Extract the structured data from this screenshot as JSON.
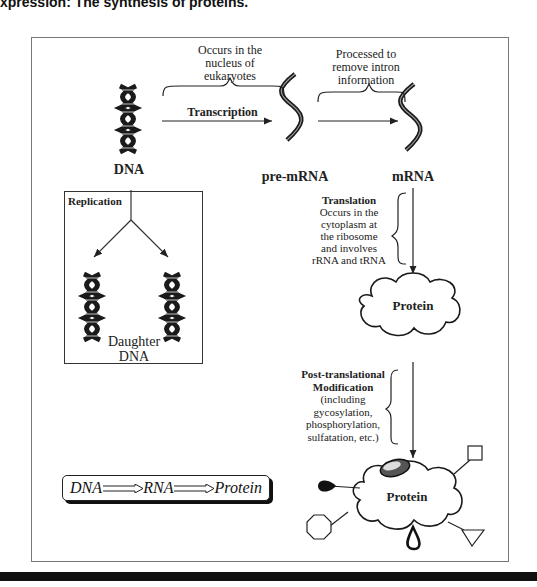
{
  "caption": "xpression: The synthesis of proteins.",
  "top_row": {
    "dna_label": "DNA",
    "pre_mrna_label": "pre-mRNA",
    "mrna_label": "mRNA",
    "transcription_label": "Transcription",
    "nucleus_note": [
      "Occurs in the",
      "nucleus of",
      "eukaryotes"
    ],
    "processing_note": [
      "Processed to",
      "remove intron",
      "information"
    ]
  },
  "replication_box": {
    "title": "Replication",
    "daughter_label": [
      "Daughter",
      "DNA"
    ]
  },
  "translation": {
    "title": "Translation",
    "note": [
      "Occurs in the",
      "cytoplasm at",
      "the ribosome",
      "and involves",
      "rRNA and tRNA"
    ]
  },
  "protein_cloud_label": "Protein",
  "post_translational": {
    "title": [
      "Post-translational",
      "Modification"
    ],
    "note": [
      "(including",
      "gycosylation,",
      "phosphorylation,",
      "sulfatation, etc.)"
    ]
  },
  "modified_protein_label": "Protein",
  "central_dogma": {
    "items": [
      "DNA",
      "RNA",
      "Protein"
    ]
  }
}
